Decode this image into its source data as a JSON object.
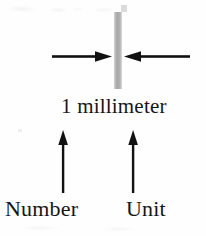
{
  "diagram": {
    "measurement_label": "1 millimeter",
    "number_label": "Number",
    "unit_label": "Unit",
    "bar": {
      "name": "millimeter-width-bar",
      "fill_color": "#a8a8a8",
      "width_px": 8,
      "height_px": 77
    },
    "background_color": "#fefefe",
    "ink_color": "#161616",
    "arrows": [
      {
        "name": "width-arrow-left",
        "direction": "right",
        "points_to": "millimeter-width-bar"
      },
      {
        "name": "width-arrow-right",
        "direction": "left",
        "points_to": "millimeter-width-bar"
      },
      {
        "name": "number-callout-arrow",
        "direction": "up",
        "points_to": "1"
      },
      {
        "name": "unit-callout-arrow",
        "direction": "up",
        "points_to": "millimeter"
      }
    ]
  }
}
